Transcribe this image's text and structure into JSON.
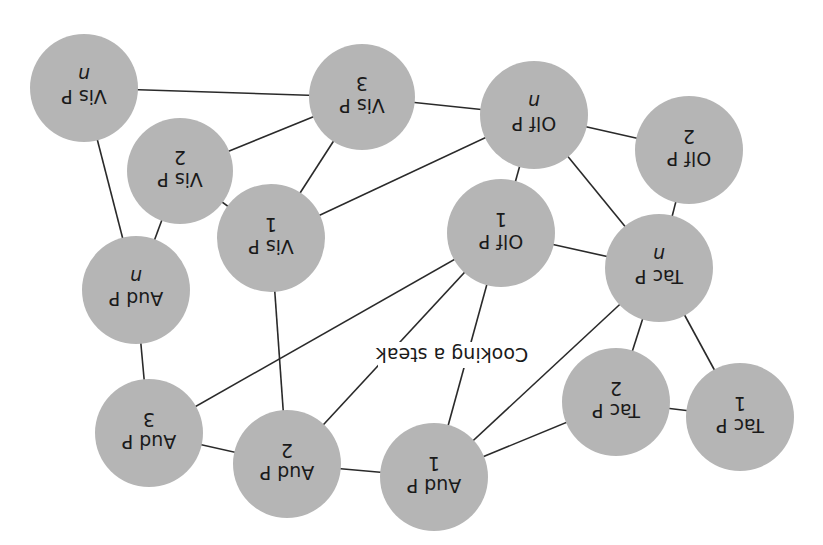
{
  "diagram": {
    "orientation": "rotated-180",
    "colors": {
      "node_fill": "#b5b5b5",
      "edge": "#2a2a2a",
      "text": "#1a1a1a",
      "background": "#ffffff"
    },
    "center_label": {
      "text": "Cooking a steak",
      "x": 452,
      "y": 355
    },
    "nodes": [
      {
        "id": "vis-p-n",
        "line1": "Vis P",
        "line2": "n",
        "italic": true,
        "x": 84,
        "y": 88,
        "r": 54
      },
      {
        "id": "vis-p-3",
        "line1": "Vis P",
        "line2": "3",
        "italic": false,
        "x": 362,
        "y": 97,
        "r": 53
      },
      {
        "id": "vis-p-2",
        "line1": "Vis P",
        "line2": "2",
        "italic": false,
        "x": 180,
        "y": 171,
        "r": 53
      },
      {
        "id": "vis-p-1",
        "line1": "Vis P",
        "line2": "1",
        "italic": false,
        "x": 271,
        "y": 238,
        "r": 54
      },
      {
        "id": "aud-p-n",
        "line1": "Aud P",
        "line2": "n",
        "italic": true,
        "x": 136,
        "y": 290,
        "r": 54
      },
      {
        "id": "off-p-n",
        "line1": "Olf P",
        "line2": "n",
        "italic": true,
        "x": 534,
        "y": 115,
        "r": 54
      },
      {
        "id": "off-p-2",
        "line1": "Olf P",
        "line2": "2",
        "italic": false,
        "x": 689,
        "y": 150,
        "r": 54
      },
      {
        "id": "off-p-1",
        "line1": "Olf P",
        "line2": "1",
        "italic": false,
        "x": 501,
        "y": 233,
        "r": 54
      },
      {
        "id": "tac-p-n",
        "line1": "Tac P",
        "line2": "n",
        "italic": true,
        "x": 659,
        "y": 268,
        "r": 54
      },
      {
        "id": "aud-p-3",
        "line1": "Aud P",
        "line2": "3",
        "italic": false,
        "x": 149,
        "y": 433,
        "r": 54
      },
      {
        "id": "aud-p-2",
        "line1": "Aud P",
        "line2": "2",
        "italic": false,
        "x": 287,
        "y": 464,
        "r": 54
      },
      {
        "id": "aud-p-1",
        "line1": "Aud P",
        "line2": "1",
        "italic": false,
        "x": 434,
        "y": 477,
        "r": 54
      },
      {
        "id": "tac-p-2",
        "line1": "Tac P",
        "line2": "2",
        "italic": false,
        "x": 616,
        "y": 402,
        "r": 54
      },
      {
        "id": "tac-p-1",
        "line1": "Tac P",
        "line2": "1",
        "italic": false,
        "x": 740,
        "y": 417,
        "r": 54
      }
    ],
    "edges": [
      [
        "vis-p-n",
        "vis-p-3"
      ],
      [
        "vis-p-n",
        "aud-p-n"
      ],
      [
        "vis-p-3",
        "vis-p-2"
      ],
      [
        "vis-p-3",
        "vis-p-1"
      ],
      [
        "vis-p-3",
        "off-p-n"
      ],
      [
        "vis-p-2",
        "vis-p-1"
      ],
      [
        "vis-p-2",
        "aud-p-n"
      ],
      [
        "vis-p-1",
        "off-p-n"
      ],
      [
        "vis-p-1",
        "aud-p-2"
      ],
      [
        "aud-p-n",
        "aud-p-3"
      ],
      [
        "aud-p-3",
        "off-p-1"
      ],
      [
        "aud-p-3",
        "aud-p-2"
      ],
      [
        "aud-p-2",
        "aud-p-1"
      ],
      [
        "aud-p-2",
        "off-p-1"
      ],
      [
        "aud-p-1",
        "off-p-1"
      ],
      [
        "aud-p-1",
        "tac-p-n"
      ],
      [
        "aud-p-1",
        "tac-p-2"
      ],
      [
        "off-p-n",
        "off-p-2"
      ],
      [
        "off-p-n",
        "off-p-1"
      ],
      [
        "off-p-n",
        "tac-p-n"
      ],
      [
        "off-p-2",
        "tac-p-n"
      ],
      [
        "off-p-1",
        "tac-p-n"
      ],
      [
        "tac-p-n",
        "tac-p-2"
      ],
      [
        "tac-p-n",
        "tac-p-1"
      ],
      [
        "tac-p-2",
        "tac-p-1"
      ]
    ]
  }
}
